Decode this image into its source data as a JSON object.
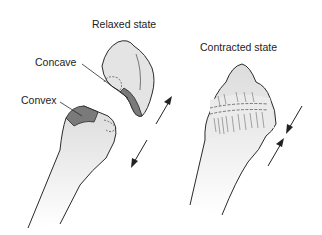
{
  "diagram": {
    "panels": [
      {
        "title": "Relaxed state",
        "parts": [
          "Concave",
          "Convex"
        ]
      },
      {
        "title": "Contracted state"
      }
    ],
    "labels": {
      "relaxed_title": "Relaxed state",
      "contracted_title": "Contracted state",
      "concave": "Concave",
      "convex": "Convex"
    },
    "colors": {
      "bone_fill": "#e4e4e4",
      "dark_surface": "#7a7a7a",
      "outline": "#2a2a2a"
    }
  }
}
